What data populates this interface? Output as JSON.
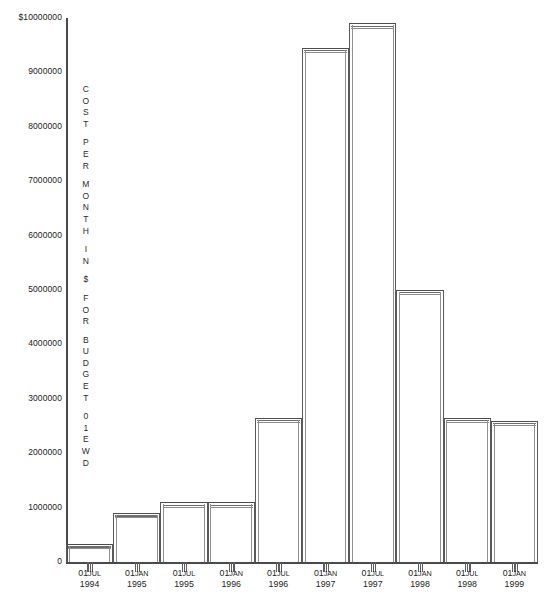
{
  "chart_data": {
    "type": "bar",
    "title": "",
    "xlabel": "",
    "ylabel": "COST PER MONTH IN $ FOR BUDGET 01EWD",
    "ylim": [
      0,
      10000000
    ],
    "grid": false,
    "legend": null,
    "categories": [
      "01JUL 1994",
      "01JAN 1995",
      "01JUL 1995",
      "01JAN 1996",
      "01JUL 1996",
      "01JAN 1997",
      "01JUL 1997",
      "01JAN 1998",
      "01JUL 1998",
      "01JAN 1999"
    ],
    "values": [
      330000,
      900000,
      1100000,
      1100000,
      2650000,
      9450000,
      9900000,
      5000000,
      2650000,
      2600000
    ],
    "ytick_labels": [
      "$10000000",
      "9000000",
      "8000000",
      "7000000",
      "6000000",
      "5000000",
      "4000000",
      "3000000",
      "2000000",
      "1000000",
      "0"
    ],
    "ytick_values": [
      10000000,
      9000000,
      8000000,
      7000000,
      6000000,
      5000000,
      4000000,
      3000000,
      2000000,
      1000000,
      0
    ]
  },
  "yaxis_title_chars": [
    "C",
    "O",
    "S",
    "T",
    "",
    "P",
    "E",
    "R",
    "",
    "M",
    "O",
    "N",
    "T",
    "H",
    "",
    "I",
    "N",
    "",
    "$",
    "",
    "F",
    "O",
    "R",
    "",
    "B",
    "U",
    "D",
    "G",
    "E",
    "T",
    "",
    "0",
    "1",
    "E",
    "W",
    "D"
  ],
  "xaxis": {
    "ticks": [
      {
        "day": "01",
        "mon": "JUL",
        "yr": "1994"
      },
      {
        "day": "01",
        "mon": "JAN",
        "yr": "1995"
      },
      {
        "day": "01",
        "mon": "JUL",
        "yr": "1995"
      },
      {
        "day": "01",
        "mon": "JAN",
        "yr": "1996"
      },
      {
        "day": "01",
        "mon": "JUL",
        "yr": "1996"
      },
      {
        "day": "01",
        "mon": "JAN",
        "yr": "1997"
      },
      {
        "day": "01",
        "mon": "JUL",
        "yr": "1997"
      },
      {
        "day": "01",
        "mon": "JAN",
        "yr": "1998"
      },
      {
        "day": "01",
        "mon": "JUL",
        "yr": "1998"
      },
      {
        "day": "01",
        "mon": "JAN",
        "yr": "1999"
      }
    ]
  },
  "caption": {
    "text": ""
  },
  "colors": {
    "axis": "#4a4a4a",
    "bar_stroke": "#5a5a5a",
    "text": "#1d1d1d",
    "background": "#ffffff"
  }
}
